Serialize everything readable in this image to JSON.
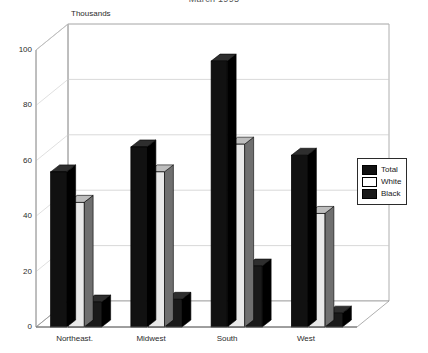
{
  "chart_data": {
    "type": "bar",
    "title": "March 1995",
    "axis_unit_label": "Thousands",
    "categories": [
      "Northeast.",
      "Midwest",
      "South",
      "West"
    ],
    "series": [
      {
        "name": "Total",
        "color": "#111111",
        "values": [
          56,
          65,
          96,
          62
        ]
      },
      {
        "name": "White",
        "color": "#e8e8e8",
        "values": [
          45,
          56,
          66,
          41
        ]
      },
      {
        "name": "Black",
        "color": "#1a1a1a",
        "values": [
          9,
          10,
          22,
          5
        ]
      }
    ],
    "xlabel": "",
    "ylabel": "Thousands",
    "ylim": [
      0,
      100
    ],
    "yticks": [
      0,
      20,
      40,
      60,
      80,
      100
    ],
    "grid": true,
    "legend_position": "right",
    "style": "3d-perspective"
  },
  "legend": {
    "entries": [
      {
        "label": "Total",
        "swatch": "black-swatch"
      },
      {
        "label": "White",
        "swatch": "white-swatch"
      },
      {
        "label": "Black",
        "swatch": "black-swatch"
      }
    ]
  }
}
